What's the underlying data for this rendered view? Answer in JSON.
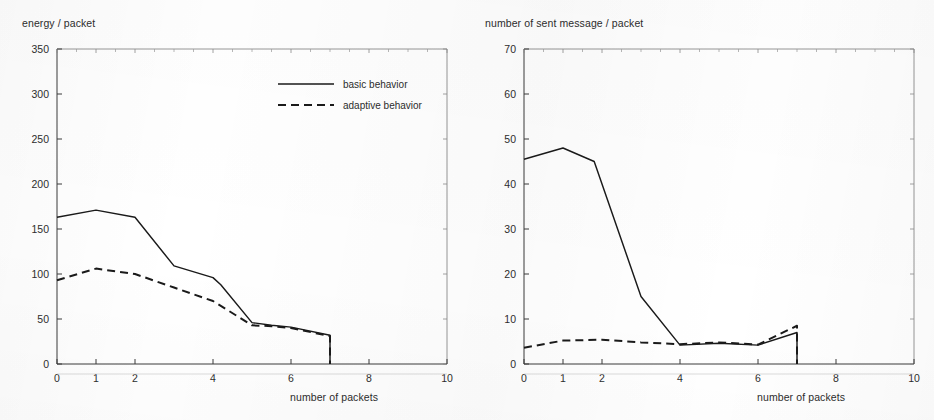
{
  "figures": [
    {
      "id": "energy",
      "ylabel": "energy / packet",
      "xlabel": "number of packets",
      "legend": {
        "basic": "basic behavior",
        "adaptive": "adaptive behavior"
      }
    },
    {
      "id": "messages",
      "ylabel": "number of sent message / packet",
      "xlabel": "number of packets"
    }
  ],
  "chart_data": [
    {
      "type": "line",
      "title": "",
      "xlabel": "number of packets",
      "ylabel": "energy / packet",
      "xlim": [
        0,
        10
      ],
      "ylim": [
        0,
        350
      ],
      "xticks": [
        0,
        1,
        2,
        4,
        6,
        8,
        10
      ],
      "xtick_labels": [
        "0",
        "1",
        "2",
        "4",
        "6",
        "8",
        "10"
      ],
      "yticks": [
        0,
        50,
        100,
        150,
        200,
        250,
        300,
        350
      ],
      "ytick_labels": [
        "0",
        "50",
        "100",
        "150",
        "200",
        "250",
        "300",
        "350"
      ],
      "grid": false,
      "legend_position": "upper right",
      "series": [
        {
          "name": "basic behavior",
          "style": "solid",
          "color": "#1a1a1a",
          "x": [
            0,
            1,
            2,
            3,
            4,
            4.2,
            5,
            5.5,
            6,
            7,
            7
          ],
          "values": [
            163,
            171,
            163,
            109,
            96,
            88,
            46,
            43,
            41,
            32,
            0
          ]
        },
        {
          "name": "adaptive behavior",
          "style": "dashed",
          "color": "#1a1a1a",
          "x": [
            0,
            1,
            2,
            3,
            4,
            5,
            5.5,
            6,
            7,
            7
          ],
          "values": [
            93,
            106,
            100,
            85,
            70,
            43,
            42,
            40,
            31,
            0
          ]
        }
      ]
    },
    {
      "type": "line",
      "title": "",
      "xlabel": "number of packets",
      "ylabel": "number of sent message / packet",
      "xlim": [
        0,
        10
      ],
      "ylim": [
        0,
        70
      ],
      "xticks": [
        0,
        1,
        2,
        4,
        6,
        8,
        10
      ],
      "xtick_labels": [
        "0",
        "1",
        "2",
        "4",
        "6",
        "8",
        "10"
      ],
      "yticks": [
        0,
        10,
        20,
        30,
        40,
        50,
        60,
        70
      ],
      "ytick_labels": [
        "0",
        "10",
        "20",
        "30",
        "40",
        "50",
        "60",
        "70"
      ],
      "grid": false,
      "legend_position": "none",
      "series": [
        {
          "name": "basic behavior",
          "style": "solid",
          "color": "#1a1a1a",
          "x": [
            0,
            1,
            1.8,
            3,
            4,
            5,
            6,
            7,
            7
          ],
          "values": [
            45.5,
            48,
            45,
            15,
            4.2,
            4.6,
            4.2,
            7,
            0
          ]
        },
        {
          "name": "adaptive behavior",
          "style": "dashed",
          "color": "#1a1a1a",
          "x": [
            0,
            1,
            2,
            3,
            4,
            5,
            6,
            7,
            7
          ],
          "values": [
            3.6,
            5.2,
            5.4,
            4.8,
            4.4,
            4.8,
            4.3,
            8.5,
            0
          ]
        }
      ]
    }
  ]
}
